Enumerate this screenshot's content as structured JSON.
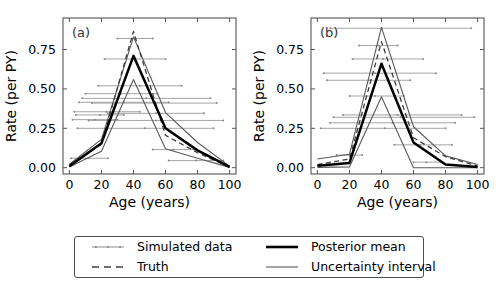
{
  "figure": {
    "background": "#ffffff",
    "panels": [
      "a",
      "b"
    ]
  },
  "legend": {
    "entries": [
      {
        "label": "Simulated data",
        "style": "thin-gray-dotted-line",
        "color": "#8c8c8c",
        "width": 0.9
      },
      {
        "label": "Truth",
        "style": "dashed-line",
        "color": "#404040",
        "width": 1.2
      },
      {
        "label": "Posterior mean",
        "style": "thick-solid-line",
        "color": "#000000",
        "width": 2.6
      },
      {
        "label": "Uncertainty interval",
        "style": "thin-solid-line",
        "color": "#595959",
        "width": 1.0
      }
    ]
  },
  "chart_data": [
    {
      "type": "line",
      "panel_label": "(a)",
      "title": "",
      "xlabel": "Age (years)",
      "ylabel": "Rate (per PY)",
      "xlim": [
        -4,
        104
      ],
      "ylim": [
        -0.04,
        0.95
      ],
      "xticks": [
        0,
        20,
        40,
        60,
        80,
        100
      ],
      "yticks": [
        0.0,
        0.25,
        0.5,
        0.75
      ],
      "ytick_labels": [
        "0.00",
        "0.25",
        "0.50",
        "0.75"
      ],
      "grid": false,
      "x": [
        0,
        20,
        40,
        60,
        80,
        100
      ],
      "series": [
        {
          "name": "Posterior mean",
          "values": [
            0.01,
            0.155,
            0.71,
            0.25,
            0.11,
            0.005
          ]
        },
        {
          "name": "Uncertainty upper",
          "values": [
            0.022,
            0.18,
            0.83,
            0.35,
            0.16,
            0.01
          ]
        },
        {
          "name": "Uncertainty lower",
          "values": [
            0.004,
            0.105,
            0.56,
            0.12,
            0.06,
            0.002
          ]
        },
        {
          "name": "Truth",
          "values": [
            0.008,
            0.15,
            0.865,
            0.205,
            0.095,
            0.004
          ]
        }
      ],
      "simulated_data": [
        {
          "x_start": 2,
          "x_end": 30,
          "x_center": 16,
          "rate": 0.305
        },
        {
          "x_start": 4,
          "x_end": 34,
          "x_center": 19,
          "rate": 0.335
        },
        {
          "x_start": 3,
          "x_end": 44,
          "x_center": 23,
          "rate": 0.355
        },
        {
          "x_start": 6,
          "x_end": 62,
          "x_center": 34,
          "rate": 0.415
        },
        {
          "x_start": 10,
          "x_end": 55,
          "x_center": 32,
          "rate": 0.47
        },
        {
          "x_start": 18,
          "x_end": 70,
          "x_center": 44,
          "rate": 0.52
        },
        {
          "x_start": 22,
          "x_end": 60,
          "x_center": 41,
          "rate": 0.69
        },
        {
          "x_start": 30,
          "x_end": 52,
          "x_center": 41,
          "rate": 0.82
        },
        {
          "x_start": 12,
          "x_end": 96,
          "x_center": 54,
          "rate": 0.3
        },
        {
          "x_start": 14,
          "x_end": 92,
          "x_center": 53,
          "rate": 0.41
        },
        {
          "x_start": 8,
          "x_end": 88,
          "x_center": 48,
          "rate": 0.44
        },
        {
          "x_start": 5,
          "x_end": 90,
          "x_center": 47,
          "rate": 0.25
        },
        {
          "x_start": 24,
          "x_end": 84,
          "x_center": 54,
          "rate": 0.345
        },
        {
          "x_start": 52,
          "x_end": 78,
          "x_center": 65,
          "rate": 0.115
        },
        {
          "x_start": 1,
          "x_end": 24,
          "x_center": 12,
          "rate": 0.06
        },
        {
          "x_start": 62,
          "x_end": 96,
          "x_center": 79,
          "rate": 0.045
        }
      ]
    },
    {
      "type": "line",
      "panel_label": "(b)",
      "title": "",
      "xlabel": "Age (years)",
      "ylabel": "Rate (per PY)",
      "xlim": [
        -4,
        104
      ],
      "ylim": [
        -0.04,
        0.95
      ],
      "xticks": [
        0,
        20,
        40,
        60,
        80,
        100
      ],
      "yticks": [
        0.0,
        0.25,
        0.5,
        0.75
      ],
      "ytick_labels": [
        "0.00",
        "0.25",
        "0.50",
        "0.75"
      ],
      "grid": false,
      "x": [
        0,
        20,
        40,
        60,
        80,
        100
      ],
      "series": [
        {
          "name": "Posterior mean",
          "values": [
            0.012,
            0.03,
            0.66,
            0.16,
            0.02,
            0.005
          ]
        },
        {
          "name": "Uncertainty upper",
          "values": [
            0.055,
            0.085,
            0.89,
            0.26,
            0.075,
            0.02
          ]
        },
        {
          "name": "Uncertainty lower",
          "values": [
            0.002,
            0.005,
            0.45,
            0.0,
            0.0,
            0.0
          ]
        },
        {
          "name": "Truth",
          "values": [
            0.02,
            0.055,
            0.8,
            0.19,
            0.07,
            0.01
          ]
        }
      ],
      "simulated_data": [
        {
          "x_start": 8,
          "x_end": 96,
          "x_center": 40,
          "rate": 0.885
        },
        {
          "x_start": 26,
          "x_end": 50,
          "x_center": 38,
          "rate": 0.775
        },
        {
          "x_start": 22,
          "x_end": 66,
          "x_center": 41,
          "rate": 0.69
        },
        {
          "x_start": 4,
          "x_end": 74,
          "x_center": 36,
          "rate": 0.6
        },
        {
          "x_start": 6,
          "x_end": 58,
          "x_center": 32,
          "rate": 0.555
        },
        {
          "x_start": 20,
          "x_end": 54,
          "x_center": 36,
          "rate": 0.455
        },
        {
          "x_start": 16,
          "x_end": 90,
          "x_center": 50,
          "rate": 0.335
        },
        {
          "x_start": 10,
          "x_end": 98,
          "x_center": 52,
          "rate": 0.32
        },
        {
          "x_start": 8,
          "x_end": 86,
          "x_center": 47,
          "rate": 0.285
        },
        {
          "x_start": 2,
          "x_end": 80,
          "x_center": 42,
          "rate": 0.25
        },
        {
          "x_start": 48,
          "x_end": 84,
          "x_center": 64,
          "rate": 0.145
        },
        {
          "x_start": 12,
          "x_end": 28,
          "x_center": 20,
          "rate": 0.08
        },
        {
          "x_start": 60,
          "x_end": 78,
          "x_center": 68,
          "rate": 0.035
        }
      ]
    }
  ]
}
